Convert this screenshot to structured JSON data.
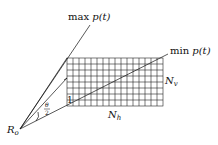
{
  "diagram": {
    "labels": {
      "max_p": "max",
      "max_p_fn": "p(t)",
      "min_p": "min",
      "min_p_fn": "p(t)",
      "n_v": "N",
      "n_v_sub": "v",
      "n_h": "N",
      "n_h_sub": "h",
      "origin": "R",
      "origin_sub": "o",
      "angle_num": "θ",
      "angle_den": "2",
      "one": "1"
    },
    "grid": {
      "columns": 16,
      "rows": 8
    },
    "colors": {
      "line": "#111111",
      "background": "#ffffff"
    }
  }
}
